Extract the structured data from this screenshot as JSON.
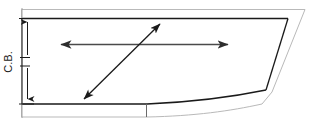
{
  "diagram": {
    "type": "engineering-outline",
    "canvas": {
      "width": 314,
      "height": 126
    },
    "colors": {
      "outer_outline": "#b9b9b9",
      "inner_outline": "#1a1a1a",
      "arrow": "#4a4a4a",
      "diagonal_arrow": "#1a1a1a",
      "dimension_line": "#1a1a1a",
      "background": "#ffffff"
    },
    "labels": {
      "cb": "C.B."
    },
    "dimension": {
      "name": "C.B.",
      "orientation": "vertical",
      "x": 27,
      "y_top": 22,
      "y_bottom": 99,
      "gap_top": 57,
      "gap_bottom": 66
    },
    "arrows": [
      {
        "name": "horizontal-width-arrow",
        "style": "double",
        "x1": 61,
        "y1": 44,
        "x2": 228,
        "y2": 44
      },
      {
        "name": "diagonal-bias-arrow",
        "style": "double",
        "x1": 84,
        "y1": 99,
        "x2": 160,
        "y2": 24
      }
    ],
    "outer_outline_path": "M 21 8 L 305 8 L 268 96 L 160 112 L 21 112 Z",
    "inner_outline_path": "M 25 18 L 289 18 L 265 90 L 150 104 L 25 104 Z",
    "edges": [
      {
        "name": "top-edge",
        "kind": "straight"
      },
      {
        "name": "right-edge-upper",
        "kind": "slanted"
      },
      {
        "name": "right-edge-lower",
        "kind": "slanted"
      },
      {
        "name": "bottom-edge",
        "kind": "curved"
      },
      {
        "name": "left-edge",
        "kind": "straight"
      }
    ],
    "tick_marks": [
      {
        "name": "bottom-seam-tick",
        "x": 146,
        "y1": 104,
        "y2": 112
      },
      {
        "name": "left-extension-top",
        "y": 18
      },
      {
        "name": "left-extension-bottom",
        "y": 104
      }
    ]
  }
}
